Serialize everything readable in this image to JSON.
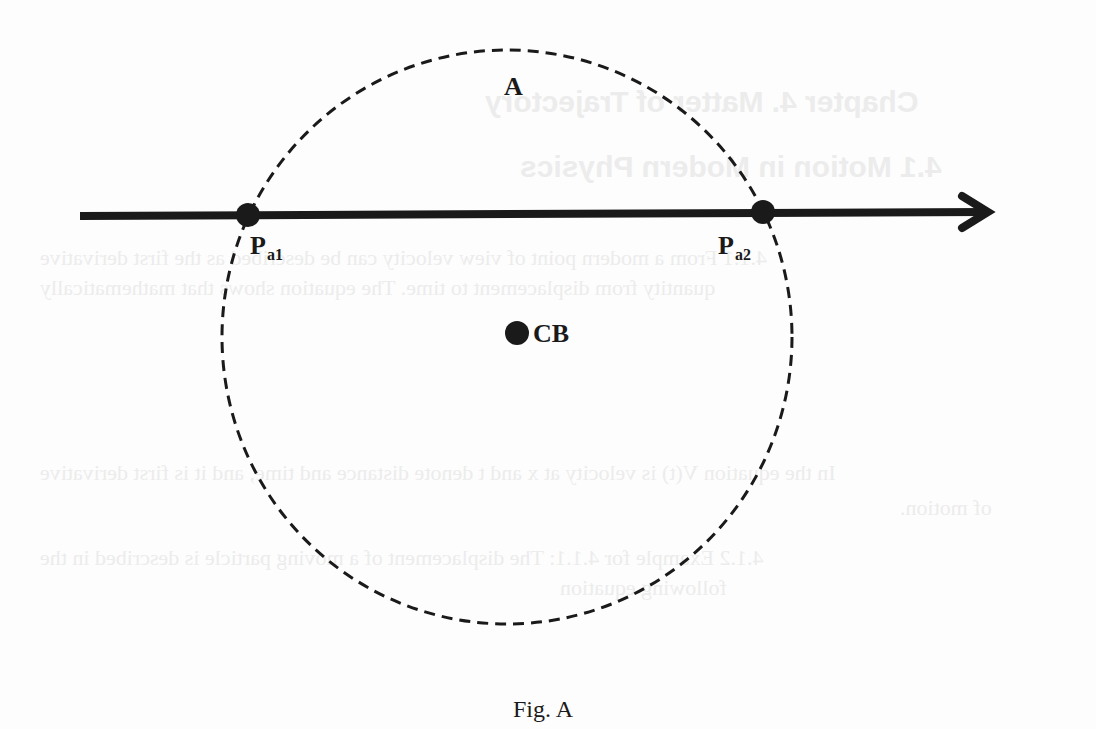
{
  "figure": {
    "caption": "Fig. A",
    "region_label": "A",
    "center_label": "CB",
    "points": [
      {
        "id": "pa1",
        "base": "P",
        "subscript": "a1"
      },
      {
        "id": "pa2",
        "base": "P",
        "subscript": "a2"
      }
    ],
    "elements": {
      "trajectory": "directed line (arrow pointing right)",
      "region": "dashed circle",
      "center": "filled dot"
    },
    "colors": {
      "ink": "#1a1a1a",
      "background": "#fdfdfd",
      "show_through": "#ececec"
    }
  },
  "show_through_text": {
    "heading1": "Chapter 4. Matter of Trajectory",
    "heading2": "4.1 Motion in Modern Physics",
    "line1": "4.1.1 From a modern point of view velocity can be described as the first derivative",
    "line2": "quantity from displacement to time. The equation shows that mathematically",
    "line3": "In the equation V(t) is velocity at x and t denote distance and time, and it is first derivative",
    "line4": "of motion.",
    "line5": "4.1.2 Example for 4.1.1: The displacement of a moving particle is described in the",
    "line6": "following equation"
  }
}
